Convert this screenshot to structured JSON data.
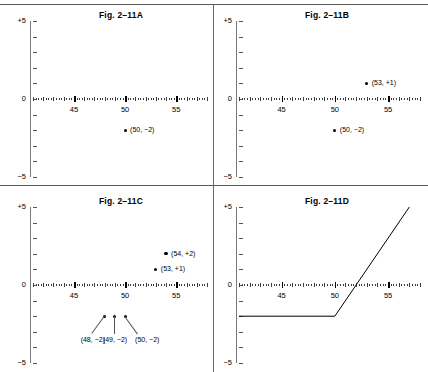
{
  "figure": {
    "caption_prefix": "Fig. 2–11",
    "axis": {
      "x_min": 41,
      "x_max": 58,
      "y_min": -5,
      "y_max": 5,
      "x_tick_labels": [
        "45",
        "50",
        "55"
      ],
      "x_tick_label_values": [
        45,
        50,
        55
      ],
      "y_tick_labels": [
        "+5",
        "0",
        "−5"
      ],
      "y_tick_label_values": [
        5,
        0,
        -5
      ],
      "x_major_values": [
        45,
        50,
        55
      ],
      "grid": false,
      "axis_style": "dotted-number-line"
    },
    "colors": {
      "ink": "#000000",
      "rule": "#5a5a5a",
      "axis": "#3a3a3a",
      "background": "#ffffff"
    }
  },
  "panels": [
    {
      "id": "a",
      "title": "Fig. 2–11A",
      "points": [
        {
          "x": 50,
          "y": -2,
          "label": "(50, −2)",
          "label_side": "right"
        }
      ],
      "line": null
    },
    {
      "id": "b",
      "title": "Fig. 2–11B",
      "points": [
        {
          "x": 53,
          "y": 1,
          "label": "(53, +1)",
          "label_side": "right"
        },
        {
          "x": 50,
          "y": -2,
          "label": "(50, −2)",
          "label_side": "right"
        }
      ],
      "line": null
    },
    {
      "id": "c",
      "title": "Fig. 2–11C",
      "points": [
        {
          "x": 54,
          "y": 2,
          "label": "(54, +2)",
          "label_side": "right"
        },
        {
          "x": 53,
          "y": 1,
          "label": "(53, +1)",
          "label_side": "right"
        },
        {
          "x": 48,
          "y": -2,
          "label": "(48, −2)",
          "label_side": "leader-left"
        },
        {
          "x": 49,
          "y": -2,
          "label": "(49, −2)",
          "label_side": "leader-down"
        },
        {
          "x": 50,
          "y": -2,
          "label": "(50, −2)",
          "label_side": "leader-right"
        }
      ],
      "line": null
    },
    {
      "id": "d",
      "title": "Fig. 2–11D",
      "points": [],
      "line": {
        "description": "flat at −2 until x=50, then rising steeply",
        "vertices": [
          {
            "x": 41,
            "y": -2
          },
          {
            "x": 50,
            "y": -2
          },
          {
            "x": 57,
            "y": 5
          }
        ]
      }
    }
  ],
  "chart_data": {
    "type": "scatter",
    "title": "Fig. 2–11",
    "xlabel": "",
    "ylabel": "",
    "xlim": [
      41,
      58
    ],
    "ylim": [
      -5,
      5
    ],
    "xticks": [
      45,
      50,
      55
    ],
    "yticks": [
      5,
      0,
      -5
    ],
    "grid": false,
    "legend": "none",
    "series": [
      {
        "name": "Fig. 2–11A",
        "x": [
          50
        ],
        "y": [
          -2
        ],
        "labels": [
          "(50, −2)"
        ]
      },
      {
        "name": "Fig. 2–11B",
        "x": [
          53,
          50
        ],
        "y": [
          1,
          -2
        ],
        "labels": [
          "(53, +1)",
          "(50, −2)"
        ]
      },
      {
        "name": "Fig. 2–11C",
        "x": [
          54,
          53,
          48,
          49,
          50
        ],
        "y": [
          2,
          1,
          -2,
          -2,
          -2
        ],
        "labels": [
          "(54, +2)",
          "(53, +1)",
          "(48, −2)",
          "(49, −2)",
          "(50, −2)"
        ]
      },
      {
        "name": "Fig. 2–11D",
        "type": "line",
        "x": [
          41,
          50,
          57
        ],
        "y": [
          -2,
          -2,
          5
        ],
        "labels": []
      }
    ]
  }
}
